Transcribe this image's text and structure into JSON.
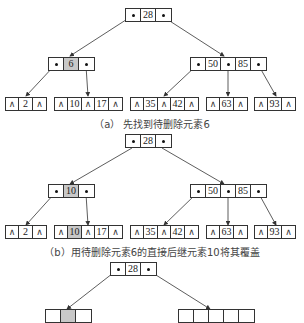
{
  "figure": {
    "panels": [
      {
        "id": "a",
        "caption": "（a） 先找到待删除元素6",
        "root": {
          "keys": [
            "28"
          ]
        },
        "level1": [
          {
            "keys": [
              "6"
            ],
            "highlight": [
              "6"
            ]
          },
          {
            "keys": [
              "50",
              "85"
            ]
          }
        ],
        "leaves": [
          {
            "keys": [
              "2"
            ]
          },
          {
            "keys": [
              "10",
              "17"
            ]
          },
          {
            "keys": [
              "35",
              "42"
            ]
          },
          {
            "keys": [
              "63"
            ]
          },
          {
            "keys": [
              "93"
            ]
          }
        ]
      },
      {
        "id": "b",
        "caption": "（b）用待删除元素6的直接后继元素10将其覆盖",
        "root": {
          "keys": [
            "28"
          ]
        },
        "level1": [
          {
            "keys": [
              "10"
            ],
            "highlight": [
              "10"
            ]
          },
          {
            "keys": [
              "50",
              "85"
            ]
          }
        ],
        "leaves": [
          {
            "keys": [
              "2"
            ]
          },
          {
            "keys": [
              "10",
              "17"
            ],
            "highlight": [
              "10"
            ]
          },
          {
            "keys": [
              "35",
              "42"
            ]
          },
          {
            "keys": [
              "63"
            ]
          },
          {
            "keys": [
              "93"
            ]
          }
        ]
      },
      {
        "id": "c",
        "caption": "",
        "root": {
          "keys": [
            "28"
          ]
        },
        "partial": true
      }
    ],
    "null_symbol": "∧",
    "pointer_symbol": "•",
    "colors": {
      "highlight": "#c8c8c8",
      "stroke": "#333333"
    }
  }
}
